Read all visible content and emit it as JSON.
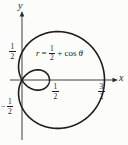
{
  "figure": {
    "axis_labels": {
      "x": "x",
      "y": "y"
    },
    "equation": {
      "var": "r",
      "equals": "=",
      "frac_num": "1",
      "frac_den": "2",
      "plus": "+",
      "func": "cos",
      "theta": "θ"
    },
    "ticks": {
      "y_positive": {
        "num": "1",
        "den": "2"
      },
      "y_negative": {
        "sign": "−",
        "num": "1",
        "den": "2"
      },
      "x_half": {
        "num": "1",
        "den": "2"
      },
      "x_three_halves": {
        "num": "3",
        "den": "2"
      }
    },
    "colors": {
      "curve": "#1c1c1c",
      "axis": "#2b2b2b",
      "background": "#fcfcfa",
      "text": "#1c1c1c"
    }
  },
  "chart_data": {
    "type": "line",
    "coordinate_system": "polar",
    "curve_kind": "limaçon with inner loop",
    "equation": "r = 1/2 + cos(θ)",
    "params": {
      "a": 0.5,
      "b": 1.0
    },
    "theta_range": [
      0,
      6.2832
    ],
    "x_tick_values": [
      0.5,
      1.5
    ],
    "y_tick_values": [
      0.5,
      -0.5
    ],
    "key_points": {
      "max_x_intercept": [
        1.5,
        0
      ],
      "inner_loop_x_intercept": [
        0.5,
        0
      ],
      "y_intercepts": [
        [
          0,
          0.5
        ],
        [
          0,
          -0.5
        ]
      ],
      "passes_through_origin": true
    },
    "xlabel": "x",
    "ylabel": "y",
    "grid": false,
    "legend": false,
    "plot": {
      "origin_px": [
        22,
        80
      ],
      "px_per_unit": 55,
      "x_axis_px": [
        10,
        118
      ],
      "y_axis_px": [
        11,
        140
      ]
    }
  }
}
